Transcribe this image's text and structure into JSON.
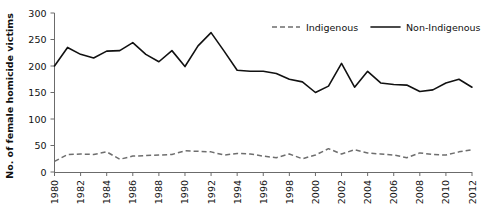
{
  "chart_data": {
    "type": "line",
    "title": "",
    "xlabel": "",
    "ylabel": "No. of female homicide victims",
    "xlim": [
      1980,
      2012
    ],
    "ylim": [
      0,
      300
    ],
    "yticks": [
      0,
      50,
      100,
      150,
      200,
      250,
      300
    ],
    "xticks": [
      1980,
      1982,
      1984,
      1986,
      1988,
      1990,
      1992,
      1994,
      1996,
      1998,
      2000,
      2002,
      2004,
      2006,
      2008,
      2010,
      2012
    ],
    "grid": false,
    "legend_position": "top-right",
    "x": [
      1980,
      1981,
      1982,
      1983,
      1984,
      1985,
      1986,
      1987,
      1988,
      1989,
      1990,
      1991,
      1992,
      1993,
      1994,
      1995,
      1996,
      1997,
      1998,
      1999,
      2000,
      2001,
      2002,
      2003,
      2004,
      2005,
      2006,
      2007,
      2008,
      2009,
      2010,
      2011,
      2012
    ],
    "series": [
      {
        "name": "Indigenous",
        "style": "dashed",
        "color": "#6e6e6e",
        "values": [
          20,
          33,
          34,
          33,
          38,
          24,
          30,
          31,
          32,
          33,
          40,
          39,
          38,
          32,
          35,
          34,
          30,
          27,
          34,
          25,
          32,
          44,
          34,
          42,
          36,
          34,
          32,
          27,
          36,
          33,
          32,
          38,
          42
        ]
      },
      {
        "name": "Non-Indigenous",
        "style": "solid",
        "color": "#111111",
        "values": [
          200,
          235,
          222,
          215,
          228,
          229,
          244,
          222,
          208,
          229,
          199,
          238,
          263,
          228,
          192,
          190,
          190,
          186,
          175,
          170,
          150,
          162,
          205,
          160,
          190,
          168,
          165,
          164,
          152,
          155,
          168,
          175,
          160
        ]
      }
    ],
    "legend": [
      {
        "label": "Indigenous",
        "style": "dashed"
      },
      {
        "label": "Non-Indigenous",
        "style": "solid"
      }
    ]
  }
}
